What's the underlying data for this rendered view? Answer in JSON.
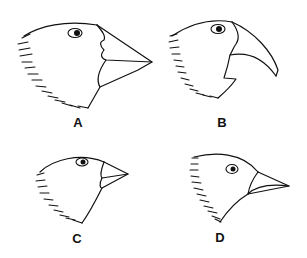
{
  "figure": {
    "birds": [
      {
        "id": "A",
        "label": "A",
        "beak": "large deep crushing beak"
      },
      {
        "id": "B",
        "label": "B",
        "beak": "large curved parrot-like beak"
      },
      {
        "id": "C",
        "label": "C",
        "beak": "small conical beak"
      },
      {
        "id": "D",
        "label": "D",
        "beak": "slender pointed beak"
      }
    ]
  },
  "colors": {
    "line": "#111111",
    "background": "#ffffff"
  }
}
